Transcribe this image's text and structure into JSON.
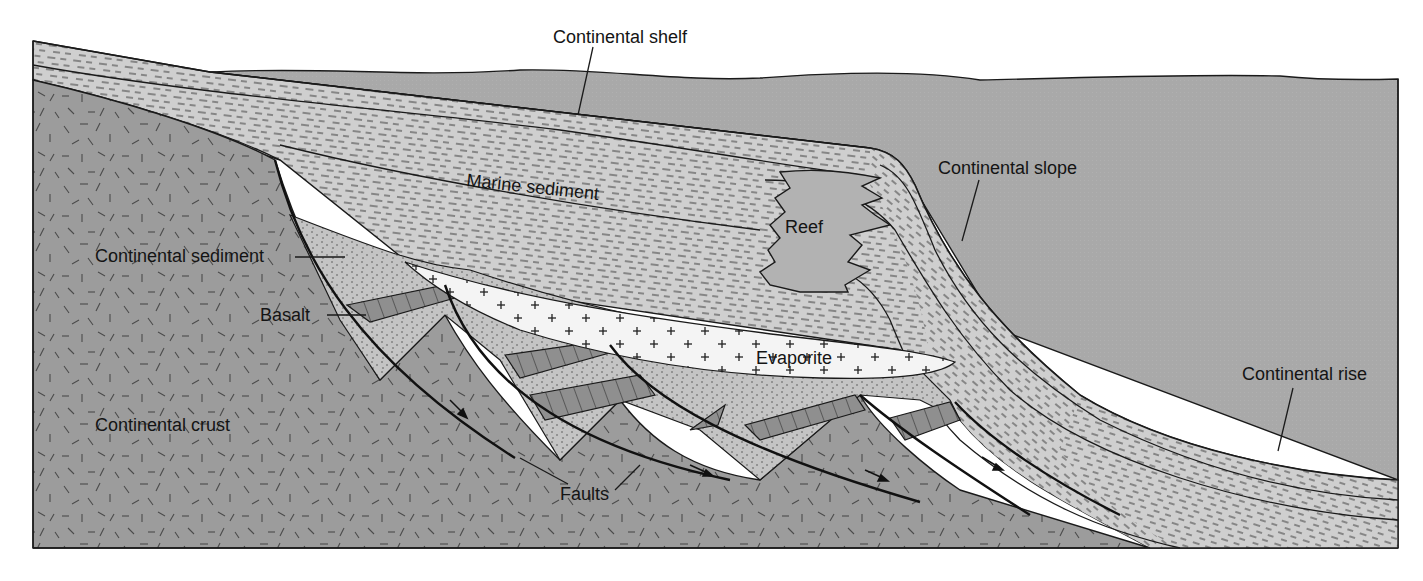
{
  "diagram": {
    "type": "geologic cross-section",
    "colors": {
      "ocean": "#a9a9a9",
      "continental_crust": "#9c9c9c",
      "marine_sediment": "#cfcfcf",
      "continental_sediment": "#c4c4c4",
      "evaporite": "#f4f4f4",
      "reef": "#b2b2b2",
      "basalt": "#8f8f8f",
      "line": "#1a1a1a",
      "background": "#ffffff"
    },
    "labels": {
      "continental_shelf": "Continental shelf",
      "continental_slope": "Continental slope",
      "continental_rise": "Continental rise",
      "marine_sediment": "Marine sediment",
      "reef": "Reef",
      "continental_sediment": "Continental sediment",
      "basalt": "Basalt",
      "evaporite": "Evaporite",
      "continental_crust": "Continental crust",
      "faults": "Faults"
    },
    "features": [
      {
        "name": "Continental shelf",
        "kind": "margin zone"
      },
      {
        "name": "Continental slope",
        "kind": "margin zone"
      },
      {
        "name": "Continental rise",
        "kind": "margin zone"
      },
      {
        "name": "Marine sediment",
        "kind": "rock unit",
        "pattern": "dashes"
      },
      {
        "name": "Reef",
        "kind": "rock unit",
        "pattern": "plain"
      },
      {
        "name": "Continental sediment",
        "kind": "rock unit",
        "pattern": "dots"
      },
      {
        "name": "Basalt",
        "kind": "rock unit",
        "pattern": "columnar"
      },
      {
        "name": "Evaporite",
        "kind": "rock unit",
        "pattern": "crosses"
      },
      {
        "name": "Continental crust",
        "kind": "basement",
        "pattern": "random ticks"
      },
      {
        "name": "Faults",
        "kind": "structure",
        "count": 5,
        "type": "normal (listric)"
      }
    ]
  }
}
